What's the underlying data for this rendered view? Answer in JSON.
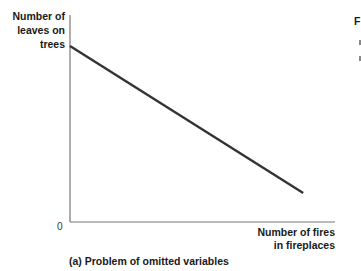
{
  "chart_data": {
    "type": "line",
    "title": "",
    "caption": "(a) Problem of omitted variables",
    "xlabel": "Number of fires\nin fireplaces",
    "ylabel": "Number of\nleaves on\ntrees",
    "origin_label": "0",
    "x_ticks": [],
    "y_ticks": [],
    "grid": false,
    "legend": null,
    "series": [
      {
        "name": "Relationship",
        "points": [
          {
            "x": 0,
            "y": 0.85
          },
          {
            "x": 0.88,
            "y": 0.14
          }
        ],
        "slope": "negative",
        "color": "#333333"
      }
    ],
    "xlim": [
      0,
      1
    ],
    "ylim": [
      0,
      1
    ],
    "axes_color": "#777777"
  },
  "cutoff_text": "F"
}
